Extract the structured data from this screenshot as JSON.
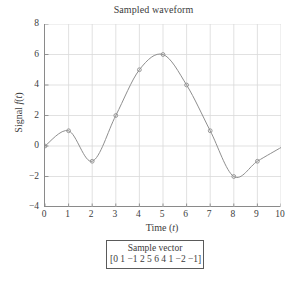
{
  "chart_data": {
    "type": "line",
    "title": "Sampled waveform",
    "xlabel_text": "Time (",
    "xlabel_var": "t",
    "xlabel_tail": ")",
    "ylabel_text": "Signal ",
    "ylabel_var1": "f",
    "ylabel_mid": "(",
    "ylabel_var2": "t",
    "ylabel_tail": ")",
    "x": [
      0,
      1,
      2,
      3,
      4,
      5,
      6,
      7,
      8,
      9
    ],
    "values": [
      0,
      1,
      -1,
      2,
      5,
      6,
      4,
      1,
      -2,
      -1
    ],
    "xlim": [
      0,
      10
    ],
    "ylim": [
      -4,
      8
    ],
    "xticks": [
      "0",
      "1",
      "2",
      "3",
      "4",
      "5",
      "6",
      "7",
      "8",
      "9",
      "10"
    ],
    "xtick_values": [
      0,
      1,
      2,
      3,
      4,
      5,
      6,
      7,
      8,
      9,
      10
    ],
    "yticks": [
      "8",
      "6",
      "4",
      "2",
      "0",
      "−2",
      "−4"
    ],
    "ytick_values": [
      8,
      6,
      4,
      2,
      0,
      -2,
      -4
    ],
    "grid": true,
    "grid_color": "#d9d9d9",
    "line_color": "#8f8f8f",
    "marker": "circle",
    "marker_color": "#8f8f8f",
    "legend_position": "below-axes",
    "interp": "smooth-spline",
    "curve_extends_to_x": 10,
    "curve_end_value": -0.1
  },
  "legend_box": {
    "title": "Sample vector",
    "vector": "[0 1 −1 2 5 6 4 1 −2 −1]"
  },
  "colors": {
    "axis": "#8a8a8a",
    "text": "#3c3c3c",
    "grid": "#d9d9d9",
    "curve": "#8f8f8f",
    "box_border": "#5a5a5a",
    "background": "#ffffff"
  }
}
